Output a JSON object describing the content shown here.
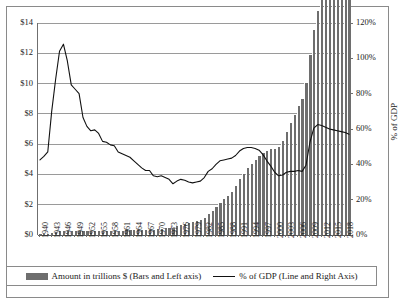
{
  "chart_data": {
    "type": "bar",
    "title": "",
    "subtitle": "",
    "xlabel": "",
    "ylabel": "",
    "ylabel_right": "% of GDP",
    "grid": true,
    "legend_position": "bottom",
    "ylim": [
      0,
      14
    ],
    "ylim_right": [
      0,
      120
    ],
    "yticks": [
      "$0",
      "$2",
      "$4",
      "$6",
      "$8",
      "$10",
      "$12",
      "$14"
    ],
    "ytick_values": [
      0,
      2,
      4,
      6,
      8,
      10,
      12,
      14
    ],
    "yticks_right": [
      "0%",
      "20%",
      "40%",
      "60%",
      "80%",
      "100%",
      "120%"
    ],
    "ytick_values_right": [
      0,
      20,
      40,
      60,
      80,
      100,
      120
    ],
    "xtick_labels": [
      "1940",
      "1943",
      "1946",
      "1949",
      "1952",
      "1955",
      "1958",
      "1961",
      "1964",
      "1967",
      "1970",
      "1973",
      "1976",
      "1979",
      "1982",
      "1985",
      "1988",
      "1991",
      "1994",
      "1997",
      "2000",
      "2003",
      "2006",
      "2009",
      "2012",
      "2015",
      "2018"
    ],
    "x": [
      1940,
      1941,
      1942,
      1943,
      1944,
      1945,
      1946,
      1947,
      1948,
      1949,
      1950,
      1951,
      1952,
      1953,
      1954,
      1955,
      1956,
      1957,
      1958,
      1959,
      1960,
      1961,
      1962,
      1963,
      1964,
      1965,
      1966,
      1967,
      1968,
      1969,
      1970,
      1971,
      1972,
      1973,
      1974,
      1975,
      1976,
      1977,
      1978,
      1979,
      1980,
      1981,
      1982,
      1983,
      1984,
      1985,
      1986,
      1987,
      1988,
      1989,
      1990,
      1991,
      1992,
      1993,
      1994,
      1995,
      1996,
      1997,
      1998,
      1999,
      2000,
      2001,
      2002,
      2003,
      2004,
      2005,
      2006,
      2007,
      2008,
      2009,
      2010,
      2011,
      2012,
      2013,
      2014,
      2015,
      2016,
      2017,
      2018,
      2019
    ],
    "series": [
      {
        "name": "Amount in trillions $ (Bars and Left axis)",
        "axis": "left",
        "type": "bar",
        "color": "#6e6e6e",
        "unit": "trillions USD",
        "values": [
          0.05,
          0.06,
          0.08,
          0.14,
          0.2,
          0.26,
          0.27,
          0.26,
          0.25,
          0.25,
          0.26,
          0.26,
          0.26,
          0.27,
          0.27,
          0.27,
          0.27,
          0.27,
          0.28,
          0.28,
          0.29,
          0.29,
          0.3,
          0.31,
          0.32,
          0.32,
          0.33,
          0.34,
          0.35,
          0.35,
          0.37,
          0.4,
          0.44,
          0.47,
          0.49,
          0.58,
          0.65,
          0.71,
          0.78,
          0.83,
          0.91,
          1.0,
          1.14,
          1.37,
          1.56,
          1.82,
          2.12,
          2.35,
          2.6,
          2.87,
          3.23,
          3.67,
          4.06,
          4.41,
          4.69,
          4.97,
          5.22,
          5.41,
          5.53,
          5.66,
          5.67,
          5.81,
          6.23,
          6.78,
          7.38,
          7.93,
          8.51,
          9.01,
          10.02,
          11.91,
          13.56,
          14.79,
          16.07,
          16.74,
          17.82,
          18.15,
          19.57,
          20.24,
          21.52,
          22.72
        ]
      },
      {
        "name": "% of GDP (Line and Right Axis)",
        "axis": "right",
        "type": "line",
        "color": "#111111",
        "unit": "percent of GDP",
        "values": [
          42.5,
          44.5,
          47.0,
          70.0,
          88.0,
          104.0,
          108.0,
          98.5,
          85.0,
          82.5,
          80.0,
          66.5,
          61.5,
          59.0,
          59.5,
          57.5,
          53.0,
          52.5,
          51.0,
          50.5,
          47.0,
          46.0,
          45.0,
          44.0,
          42.0,
          40.0,
          38.0,
          36.5,
          36.5,
          33.5,
          33.0,
          33.5,
          32.5,
          31.5,
          29.0,
          30.5,
          31.5,
          31.0,
          30.0,
          29.5,
          30.0,
          30.5,
          32.5,
          36.0,
          37.5,
          40.0,
          42.0,
          42.5,
          43.0,
          43.5,
          45.0,
          47.5,
          49.0,
          49.5,
          49.5,
          49.0,
          48.0,
          45.5,
          42.0,
          39.0,
          35.5,
          33.5,
          34.0,
          35.5,
          36.0,
          36.0,
          36.5,
          36.0,
          39.5,
          52.5,
          60.5,
          62.5,
          62.0,
          61.0,
          60.0,
          59.5,
          59.0,
          58.5,
          58.0,
          57.0
        ]
      }
    ]
  },
  "legend": {
    "items": [
      {
        "label": "Amount in trillions $ (Bars and Left axis)",
        "marker": "bar-swatch"
      },
      {
        "label": "% of GDP (Line and Right Axis)",
        "marker": "line-swatch"
      }
    ]
  },
  "axes": {
    "right_title": "% of GDP"
  }
}
